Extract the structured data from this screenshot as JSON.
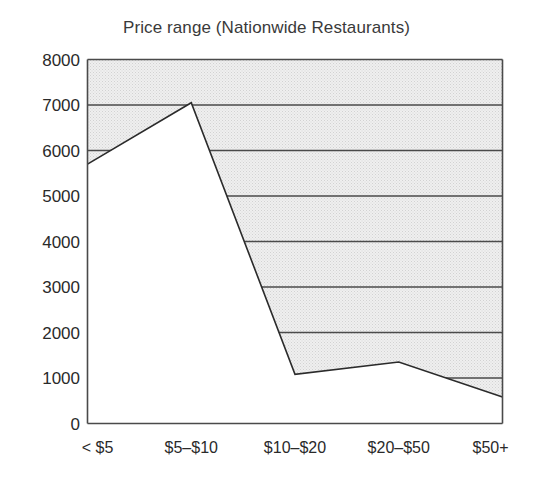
{
  "chart_data": {
    "type": "line",
    "title": "Price range (Nationwide Restaurants)",
    "subtitle": "",
    "xlabel": "",
    "ylabel": "",
    "categories": [
      "< $5",
      "$5–$10",
      "$10–$20",
      "$20–$50",
      "$50+"
    ],
    "values": [
      5700,
      7050,
      1080,
      1350,
      580
    ],
    "series": [
      {
        "name": "Restaurants",
        "values": [
          5700,
          7050,
          1080,
          1350,
          580
        ]
      }
    ],
    "ylim": [
      0,
      8000
    ],
    "ytick_values": [
      0,
      1000,
      2000,
      3000,
      4000,
      5000,
      6000,
      7000,
      8000
    ],
    "ytick_labels": [
      "0",
      "1000",
      "2000",
      "3000",
      "4000",
      "5000",
      "6000",
      "7000",
      "8000"
    ],
    "grid": true,
    "grid_orientation": "horizontal",
    "grid_region": "above-line",
    "legend": "none",
    "fill_region": "above-line",
    "annotations": []
  },
  "style": {
    "line_color": "#2b2b2b",
    "fill_color": "#e8e8e8",
    "grid_color": "#4a4a4a",
    "axis_color": "#4a4a4a",
    "background": "#ffffff",
    "text_color": "#2a2a2a",
    "title_color": "#3a3a3a"
  },
  "axes": {
    "title_text": "Price range (Nationwide Restaurants)",
    "y_axis_name": "y-axis",
    "x_axis_name": "x-axis"
  }
}
